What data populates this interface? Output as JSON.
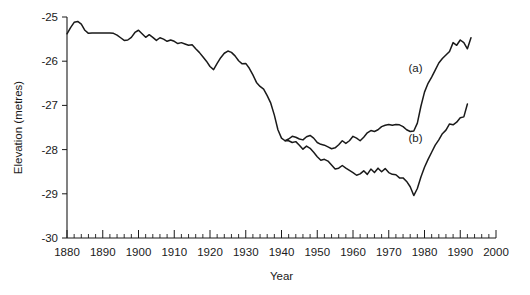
{
  "chart_data": {
    "type": "line",
    "title": "",
    "xlabel": "Year",
    "ylabel": "Elevation (metres)",
    "xlim": [
      1880,
      2000
    ],
    "ylim": [
      -30,
      -25
    ],
    "grid": false,
    "legend_position": "inline-annotation",
    "x_ticks_major": [
      1880,
      1890,
      1900,
      1910,
      1920,
      1930,
      1940,
      1950,
      1960,
      1970,
      1980,
      1990,
      2000
    ],
    "x_tick_labels": [
      "1880",
      "1890",
      "1900",
      "1910",
      "1920",
      "1930",
      "1940",
      "1950",
      "1960",
      "1970",
      "1980",
      "1990",
      "2000"
    ],
    "x_minor_tick_interval": 2,
    "y_ticks_major": [
      -25,
      -26,
      -27,
      -28,
      -29,
      -30
    ],
    "y_tick_labels": [
      "-25",
      "-26",
      "-27",
      "-28",
      "-29",
      "-30"
    ],
    "annotations": [
      {
        "text": "(a)",
        "x": 1977.5,
        "y": -26.25
      },
      {
        "text": "(b)",
        "x": 1977.5,
        "y": -27.82
      }
    ],
    "series": [
      {
        "name": "(a)",
        "label": "(a)",
        "color": "#1a1a1a",
        "x": [
          1880,
          1881,
          1882,
          1883,
          1884,
          1885,
          1886,
          1887,
          1888,
          1889,
          1890,
          1891,
          1892,
          1893,
          1894,
          1895,
          1896,
          1897,
          1898,
          1899,
          1900,
          1901,
          1902,
          1903,
          1904,
          1905,
          1906,
          1907,
          1908,
          1909,
          1910,
          1911,
          1912,
          1913,
          1914,
          1915,
          1916,
          1917,
          1918,
          1919,
          1920,
          1921,
          1922,
          1923,
          1924,
          1925,
          1926,
          1927,
          1928,
          1929,
          1930,
          1931,
          1932,
          1933,
          1934,
          1935,
          1936,
          1937,
          1938,
          1939,
          1940,
          1941,
          1942,
          1943,
          1944,
          1945,
          1946,
          1947,
          1948,
          1949,
          1950,
          1951,
          1952,
          1953,
          1954,
          1955,
          1956,
          1957,
          1958,
          1959,
          1960,
          1961,
          1962,
          1963,
          1964,
          1965,
          1966,
          1967,
          1968,
          1969,
          1970,
          1971,
          1972,
          1973,
          1974,
          1975,
          1976,
          1977,
          1978,
          1979,
          1980,
          1981,
          1982,
          1983,
          1984,
          1985,
          1986,
          1987,
          1988,
          1989,
          1990,
          1991,
          1992,
          1993
        ],
        "values": [
          -25.38,
          -25.24,
          -25.12,
          -25.1,
          -25.16,
          -25.3,
          -25.37,
          -25.36,
          -25.36,
          -25.36,
          -25.36,
          -25.36,
          -25.36,
          -25.37,
          -25.41,
          -25.47,
          -25.53,
          -25.52,
          -25.46,
          -25.35,
          -25.3,
          -25.38,
          -25.46,
          -25.4,
          -25.46,
          -25.53,
          -25.47,
          -25.5,
          -25.55,
          -25.52,
          -25.55,
          -25.6,
          -25.58,
          -25.61,
          -25.64,
          -25.63,
          -25.72,
          -25.8,
          -25.9,
          -26.0,
          -26.12,
          -26.19,
          -26.05,
          -25.92,
          -25.82,
          -25.77,
          -25.8,
          -25.88,
          -25.99,
          -26.06,
          -26.05,
          -26.16,
          -26.31,
          -26.48,
          -26.57,
          -26.63,
          -26.78,
          -26.95,
          -27.22,
          -27.55,
          -27.74,
          -27.8,
          -27.76,
          -27.7,
          -27.72,
          -27.76,
          -27.78,
          -27.71,
          -27.68,
          -27.74,
          -27.84,
          -27.88,
          -27.9,
          -27.94,
          -27.98,
          -27.96,
          -27.89,
          -27.8,
          -27.86,
          -27.8,
          -27.7,
          -27.74,
          -27.8,
          -27.72,
          -27.62,
          -27.57,
          -27.59,
          -27.55,
          -27.48,
          -27.45,
          -27.43,
          -27.45,
          -27.43,
          -27.44,
          -27.48,
          -27.55,
          -27.59,
          -27.58,
          -27.4,
          -27.02,
          -26.7,
          -26.5,
          -26.36,
          -26.2,
          -26.04,
          -25.94,
          -25.86,
          -25.78,
          -25.58,
          -25.64,
          -25.52,
          -25.58,
          -25.72,
          -25.47
        ]
      },
      {
        "name": "(b)",
        "label": "(b)",
        "color": "#1a1a1a",
        "x": [
          1941,
          1942,
          1943,
          1944,
          1945,
          1946,
          1947,
          1948,
          1949,
          1950,
          1951,
          1952,
          1953,
          1954,
          1955,
          1956,
          1957,
          1958,
          1959,
          1960,
          1961,
          1962,
          1963,
          1964,
          1965,
          1966,
          1967,
          1968,
          1969,
          1970,
          1971,
          1972,
          1973,
          1974,
          1975,
          1976,
          1977,
          1978,
          1979,
          1980,
          1981,
          1982,
          1983,
          1984,
          1985,
          1986,
          1987,
          1988,
          1989,
          1990,
          1991,
          1992
        ],
        "values": [
          -27.8,
          -27.8,
          -27.84,
          -27.82,
          -27.9,
          -27.99,
          -27.92,
          -27.97,
          -28.06,
          -28.16,
          -28.24,
          -28.22,
          -28.26,
          -28.35,
          -28.44,
          -28.42,
          -28.36,
          -28.42,
          -28.47,
          -28.52,
          -28.58,
          -28.55,
          -28.48,
          -28.56,
          -28.44,
          -28.52,
          -28.42,
          -28.5,
          -28.43,
          -28.52,
          -28.56,
          -28.57,
          -28.64,
          -28.64,
          -28.72,
          -28.84,
          -29.04,
          -28.88,
          -28.62,
          -28.4,
          -28.22,
          -28.06,
          -27.9,
          -27.78,
          -27.64,
          -27.56,
          -27.42,
          -27.44,
          -27.38,
          -27.28,
          -27.26,
          -26.97
        ]
      }
    ]
  }
}
